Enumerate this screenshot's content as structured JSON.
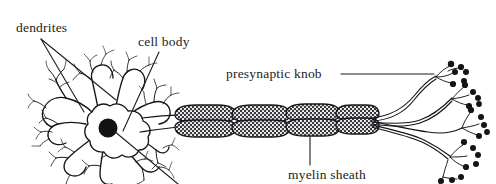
{
  "figure": {
    "background_color": "#ffffff",
    "ink_color": "#16161a",
    "width": 496,
    "height": 184
  },
  "labels": [
    {
      "id": "dendrites",
      "text": "dendrites",
      "x": 16,
      "y": 32,
      "leader_style": "two-fan-lines",
      "points_to": "dendritic-branches"
    },
    {
      "id": "cell_body",
      "text": "cell body",
      "x": 138,
      "y": 46,
      "leader_style": "single-diagonal",
      "points_to": "soma"
    },
    {
      "id": "presynaptic_knob",
      "text": "presynaptic knob",
      "x": 226,
      "y": 78,
      "leader_style": "horizontal",
      "points_to": "terminal-knob-cluster"
    },
    {
      "id": "myelin_sheath",
      "text": "myelin sheath",
      "x": 288,
      "y": 179,
      "leader_style": "vertical",
      "points_to": "myelin-segment-3"
    }
  ],
  "structures": {
    "soma": {
      "name": "cell body",
      "center_x": 108,
      "center_y": 128,
      "nucleus_radius": 9.5,
      "nucleus_color": "#121215"
    },
    "dendrites": {
      "name": "dendrites",
      "count": 9,
      "description": "branching tree-like processes radiating from the soma"
    },
    "axon": {
      "name": "axon",
      "start_x": 150,
      "end_x": 372,
      "y": 120
    },
    "myelin": {
      "name": "myelin sheath",
      "segment_count": 4,
      "segment_centers_x": [
        203,
        258,
        311,
        356
      ],
      "texture": "stippled",
      "fill_color": "#3a3a3e"
    },
    "terminals": {
      "name": "presynaptic knobs",
      "cluster_count": 5,
      "knob_color": "#141418",
      "knob_radius": 3.1
    }
  }
}
